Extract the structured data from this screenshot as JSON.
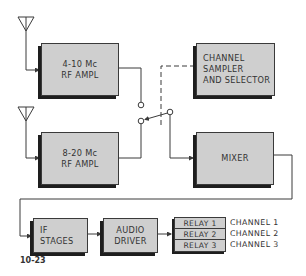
{
  "diagram": {
    "figure_label": "10-23",
    "blocks": {
      "rf_ampl_1": {
        "line1": "4-10 Mc",
        "line2": "RF AMPL"
      },
      "rf_ampl_2": {
        "line1": "8-20 Mc",
        "line2": "RF AMPL"
      },
      "sampler": {
        "line1": "CHANNEL",
        "line2": "SAMPLER",
        "line3": "AND SELECTOR"
      },
      "mixer": {
        "label": "MIXER"
      },
      "if_stages": {
        "line1": "IF",
        "line2": "STAGES"
      },
      "audio_driver": {
        "line1": "AUDIO",
        "line2": "DRIVER"
      }
    },
    "relays": [
      {
        "label": "RELAY 1",
        "channel": "CHANNEL 1"
      },
      {
        "label": "RELAY 2",
        "channel": "CHANNEL 2"
      },
      {
        "label": "RELAY 3",
        "channel": "CHANNEL 3"
      }
    ],
    "colors": {
      "block_fill": "#cfcfcf",
      "line": "#3a3a3a",
      "shadow": "#1e1e1e"
    }
  }
}
